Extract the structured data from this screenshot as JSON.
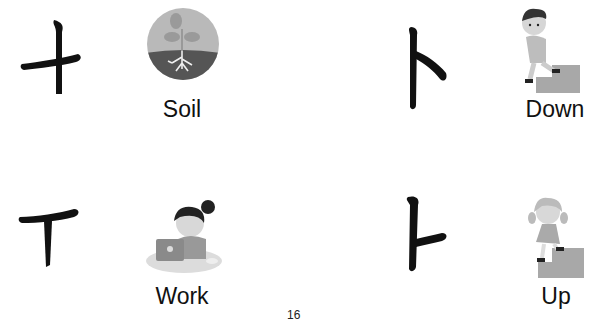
{
  "slide": {
    "page_number": "16",
    "items": [
      {
        "character": "ㅜ-variant",
        "label": "Soil",
        "icon": "plant-in-soil-icon"
      },
      {
        "character": "ㅏ",
        "label": "Down",
        "icon": "boy-walking-down-stairs-icon"
      },
      {
        "character": "ㅜ-variant",
        "label": "Work",
        "icon": "woman-at-laptop-icon"
      },
      {
        "character": "ㅏ",
        "label": "Up",
        "icon": "girl-walking-up-stairs-icon"
      }
    ]
  }
}
